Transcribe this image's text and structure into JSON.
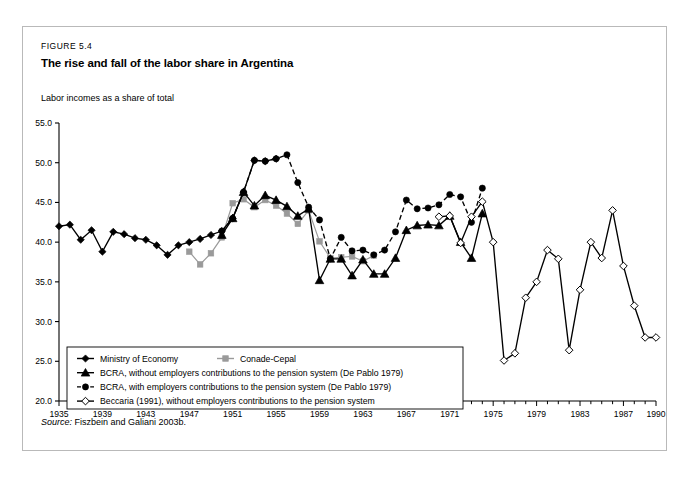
{
  "figure": {
    "label": "FIGURE 5.4",
    "title": "The rise and fall of the labor share in Argentina",
    "axis_note": "Labor incomes as a share of total",
    "source_label": "Source:",
    "source_text": "Fiszbein and Galiani 2003b."
  },
  "chart_data": {
    "type": "line",
    "title": "The rise and fall of the labor share in Argentina",
    "subtitle": "Labor incomes as a share of total",
    "xlabel": "",
    "ylabel": "Labor incomes as a share of total",
    "xlim": [
      1935,
      1990
    ],
    "ylim": [
      20.0,
      55.0
    ],
    "ytick_step": 5.0,
    "yticks": [
      "20.0",
      "25.0",
      "30.0",
      "35.0",
      "40.0",
      "45.0",
      "50.0",
      "55.0"
    ],
    "xticks": [
      1935,
      1939,
      1943,
      1947,
      1951,
      1955,
      1959,
      1963,
      1967,
      1971,
      1975,
      1979,
      1983,
      1987,
      1990
    ],
    "xtick_labels": [
      "1935",
      "1939",
      "1943",
      "1947",
      "1951",
      "1955",
      "1959",
      "1963",
      "1967",
      "1971",
      "1975",
      "1979",
      "1983",
      "1987",
      "1990"
    ],
    "xtick_minor_every": 1,
    "grid": false,
    "legend_position": "lower-left-inside",
    "series": [
      {
        "name": "Ministry of Economy",
        "marker": "diamond-filled",
        "line": "solid",
        "color": "#000000",
        "x": [
          1935,
          1936,
          1937,
          1938,
          1939,
          1940,
          1941,
          1942,
          1943,
          1944,
          1945,
          1946,
          1947,
          1948,
          1949,
          1950,
          1951,
          1952,
          1953,
          1954,
          1955
        ],
        "y": [
          42.0,
          42.2,
          40.3,
          41.5,
          38.8,
          41.3,
          41.0,
          40.5,
          40.3,
          39.6,
          38.4,
          39.6,
          40.0,
          40.4,
          40.9,
          41.4,
          43.0,
          46.3,
          50.3,
          50.2,
          50.5
        ]
      },
      {
        "name": "Conade-Cepal",
        "marker": "square-filled",
        "line": "solid",
        "color": "#9a9a9a",
        "x": [
          1947,
          1948,
          1949,
          1950,
          1951,
          1952,
          1953,
          1954,
          1955,
          1956,
          1957,
          1958,
          1959,
          1960,
          1961,
          1962,
          1963,
          1964
        ],
        "y": [
          38.8,
          37.2,
          38.6,
          40.6,
          44.9,
          45.4,
          44.4,
          45.3,
          44.6,
          43.6,
          42.3,
          44.0,
          40.1,
          38.0,
          38.1,
          38.2,
          37.6,
          38.3
        ]
      },
      {
        "name": "BCRA, without employers contributions to the pension system (De Pablo 1979)",
        "marker": "triangle-filled",
        "line": "solid",
        "color": "#000000",
        "x": [
          1950,
          1951,
          1952,
          1953,
          1954,
          1955,
          1956,
          1957,
          1958,
          1959,
          1960,
          1961,
          1962,
          1963,
          1964,
          1965,
          1966,
          1967,
          1968,
          1969,
          1970,
          1971,
          1972,
          1973,
          1974
        ],
        "y": [
          40.9,
          43.0,
          46.3,
          44.6,
          45.9,
          45.3,
          44.5,
          43.3,
          44.2,
          35.2,
          37.9,
          37.9,
          35.8,
          37.8,
          36.0,
          36.0,
          38.0,
          41.5,
          42.1,
          42.2,
          42.1,
          43.3,
          40.0,
          38.0,
          43.6
        ]
      },
      {
        "name": "BCRA, with employers contributions to the pension system (De Pablo 1979)",
        "marker": "circle-filled",
        "line": "dashed",
        "color": "#000000",
        "x": [
          1950,
          1951,
          1952,
          1953,
          1954,
          1955,
          1956,
          1957,
          1958,
          1959,
          1960,
          1961,
          1962,
          1963,
          1964,
          1965,
          1966,
          1967,
          1968,
          1969,
          1970,
          1971,
          1972,
          1973,
          1974
        ],
        "y": [
          41.4,
          43.0,
          46.3,
          50.3,
          50.2,
          50.5,
          51.0,
          47.5,
          44.4,
          42.8,
          37.9,
          40.6,
          38.9,
          39.0,
          38.4,
          39.0,
          41.3,
          45.3,
          44.2,
          44.3,
          44.7,
          46.0,
          45.7,
          42.5,
          46.8
        ]
      },
      {
        "name": "Beccaria (1991), without employers contributions to the pension system",
        "marker": "diamond-open",
        "line": "solid",
        "color": "#000000",
        "x": [
          1970,
          1971,
          1972,
          1973,
          1974,
          1975,
          1976,
          1977,
          1978,
          1979,
          1980,
          1981,
          1982,
          1983,
          1984,
          1985,
          1986,
          1987,
          1988,
          1989,
          1990
        ],
        "y": [
          43.2,
          43.3,
          39.9,
          43.2,
          45.1,
          40.0,
          25.1,
          26.0,
          33.0,
          35.0,
          39.0,
          37.9,
          26.4,
          34.0,
          40.0,
          38.0,
          44.0,
          37.0,
          32.0,
          28.0,
          28.0
        ]
      }
    ]
  },
  "legend": {
    "entries": [
      {
        "label": "Ministry of Economy",
        "marker": "diamond-filled",
        "line": "solid"
      },
      {
        "label": "Conade-Cepal",
        "marker": "square-filled",
        "line": "solid"
      },
      {
        "label": "BCRA, without employers contributions to the pension system (De Pablo 1979)",
        "marker": "triangle-filled",
        "line": "solid"
      },
      {
        "label": "BCRA, with employers contributions to the pension system (De Pablo 1979)",
        "marker": "circle-filled",
        "line": "dashed"
      },
      {
        "label": "Beccaria (1991), without employers contributions to the pension system",
        "marker": "diamond-open",
        "line": "solid"
      }
    ]
  },
  "colors": {
    "ink": "#000000",
    "grey_series": "#9a9a9a",
    "frame": "#b9b9b9"
  }
}
